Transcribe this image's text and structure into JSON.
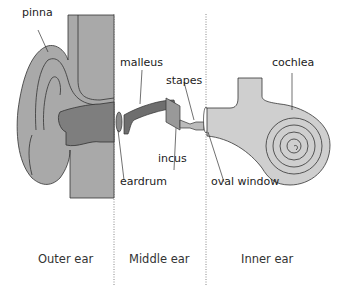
{
  "diagram": {
    "labels": {
      "pinna": "pinna",
      "malleus": "malleus",
      "stapes": "stapes",
      "incus": "incus",
      "eardrum": "eardrum",
      "oval_window": "oval window",
      "cochlea": "cochlea"
    },
    "sections": [
      {
        "label": "Outer ear"
      },
      {
        "label": "Middle ear"
      },
      {
        "label": "Inner ear"
      }
    ],
    "colors": {
      "ear_fill": "#a9a9a9",
      "ear_dark": "#7e7e7e",
      "bone_dark": "#6e6e6e",
      "inner_fill": "#cfcfcf",
      "line": "#333333",
      "divider": "#888888"
    }
  }
}
